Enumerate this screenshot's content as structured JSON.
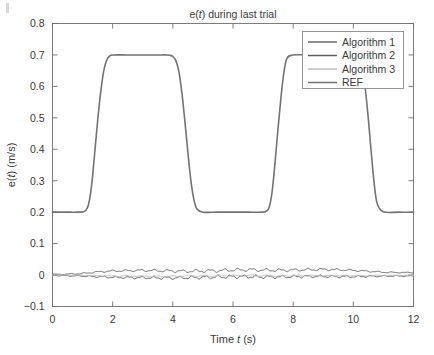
{
  "figure": {
    "title": "e(t) during last trial",
    "title_parts": {
      "pre": "e(",
      "italic": "t",
      "post": ") during last trial"
    },
    "background_color": "#ffffff",
    "axis_color": "#6e6e6e",
    "text_color": "#3a3a3a"
  },
  "axes": {
    "x": {
      "label_parts": {
        "pre": "Time ",
        "italic": "t",
        "post": " (s)"
      },
      "label": "Time t (s)",
      "min": 0,
      "max": 12,
      "tick_values": [
        0,
        2,
        4,
        6,
        8,
        10,
        12
      ],
      "tick_labels": [
        "0",
        "2",
        "4",
        "6",
        "8",
        "10",
        "12"
      ]
    },
    "y": {
      "label_parts": {
        "pre": "e(",
        "italic": "t",
        "post": ") (m/s)"
      },
      "label": "e(t) (m/s)",
      "min": -0.1,
      "max": 0.8,
      "tick_values": [
        -0.1,
        0,
        0.1,
        0.2,
        0.3,
        0.4,
        0.5,
        0.6,
        0.7,
        0.8
      ],
      "tick_labels": [
        "-0.1",
        "0",
        "0.1",
        "0.2",
        "0.3",
        "0.4",
        "0.5",
        "0.6",
        "0.7",
        "0.8"
      ]
    }
  },
  "legend": {
    "position": "top-right",
    "items": [
      {
        "label": "Algorithm 1",
        "color": "#6b6b6b",
        "width": 1.5
      },
      {
        "label": "Algorithm 2",
        "color": "#5f5f5f",
        "width": 1.5
      },
      {
        "label": "Algorithm 3",
        "color": "#bcbcbc",
        "width": 1.5
      },
      {
        "label": "REF",
        "color": "#737373",
        "width": 1.5
      }
    ]
  },
  "chart_data": {
    "type": "line",
    "title": "e(t) during last trial",
    "xlabel": "Time t (s)",
    "ylabel": "e(t) (m/s)",
    "xlim": [
      0,
      12
    ],
    "ylim": [
      -0.1,
      0.8
    ],
    "grid": false,
    "legend_position": "top-right",
    "series": [
      {
        "name": "REF",
        "color": "#737373",
        "comment": "smoothed square/trapezoid wave, low level 0.2, high level 0.7",
        "x": [
          0,
          0.2,
          0.4,
          0.6,
          0.8,
          1.0,
          1.1,
          1.2,
          1.3,
          1.4,
          1.5,
          1.6,
          1.7,
          1.8,
          1.9,
          2.0,
          2.5,
          3.0,
          3.5,
          3.8,
          3.9,
          4.0,
          4.1,
          4.2,
          4.3,
          4.4,
          4.5,
          4.6,
          4.7,
          4.8,
          5.0,
          5.5,
          6.0,
          6.5,
          7.0,
          7.1,
          7.2,
          7.3,
          7.4,
          7.5,
          7.6,
          7.7,
          7.8,
          8.0,
          8.5,
          9.0,
          9.5,
          10.0,
          10.1,
          10.2,
          10.3,
          10.4,
          10.5,
          10.6,
          10.7,
          10.8,
          11.0,
          11.5,
          12.0
        ],
        "y": [
          0.2,
          0.2,
          0.2,
          0.2,
          0.2,
          0.201,
          0.205,
          0.225,
          0.285,
          0.385,
          0.49,
          0.58,
          0.648,
          0.683,
          0.696,
          0.7,
          0.7,
          0.7,
          0.7,
          0.7,
          0.699,
          0.695,
          0.682,
          0.648,
          0.58,
          0.49,
          0.39,
          0.3,
          0.24,
          0.21,
          0.2,
          0.2,
          0.2,
          0.2,
          0.2,
          0.203,
          0.215,
          0.265,
          0.36,
          0.47,
          0.57,
          0.65,
          0.69,
          0.7,
          0.7,
          0.7,
          0.7,
          0.7,
          0.698,
          0.69,
          0.66,
          0.59,
          0.495,
          0.385,
          0.285,
          0.225,
          0.201,
          0.2,
          0.2
        ]
      },
      {
        "name": "Algorithm 1",
        "color": "#6b6b6b",
        "comment": "near-zero error trace, small ripples, slight positive bias mid-record",
        "x": [
          0,
          0.5,
          1.0,
          1.5,
          2.0,
          2.5,
          3.0,
          3.5,
          4.0,
          4.5,
          5.0,
          5.5,
          6.0,
          6.5,
          7.0,
          7.5,
          8.0,
          8.5,
          9.0,
          9.5,
          10.0,
          10.5,
          11.0,
          11.5,
          12.0
        ],
        "y": [
          0.002,
          0.003,
          0.005,
          0.01,
          0.013,
          0.014,
          0.015,
          0.014,
          0.013,
          0.012,
          0.013,
          0.014,
          0.016,
          0.017,
          0.016,
          0.015,
          0.016,
          0.017,
          0.018,
          0.017,
          0.015,
          0.012,
          0.009,
          0.008,
          0.008
        ]
      },
      {
        "name": "Algorithm 2",
        "color": "#5f5f5f",
        "comment": "near-zero error trace, oscillatory ripple slightly below zero",
        "x": [
          0,
          0.5,
          1.0,
          1.5,
          2.0,
          2.5,
          3.0,
          3.5,
          4.0,
          4.5,
          5.0,
          5.5,
          6.0,
          6.5,
          7.0,
          7.5,
          8.0,
          8.5,
          9.0,
          9.5,
          10.0,
          10.5,
          11.0,
          11.5,
          12.0
        ],
        "y": [
          -0.001,
          -0.002,
          -0.003,
          -0.005,
          -0.007,
          -0.008,
          -0.008,
          -0.009,
          -0.009,
          -0.008,
          -0.007,
          -0.006,
          -0.005,
          -0.005,
          -0.006,
          -0.006,
          -0.005,
          -0.004,
          -0.004,
          -0.005,
          -0.005,
          -0.004,
          -0.003,
          -0.003,
          -0.003
        ]
      },
      {
        "name": "Algorithm 3",
        "color": "#bcbcbc",
        "comment": "near-zero error trace, lightest grey, very small amplitude",
        "x": [
          0,
          0.5,
          1.0,
          1.5,
          2.0,
          2.5,
          3.0,
          3.5,
          4.0,
          4.5,
          5.0,
          5.5,
          6.0,
          6.5,
          7.0,
          7.5,
          8.0,
          8.5,
          9.0,
          9.5,
          10.0,
          10.5,
          11.0,
          11.5,
          12.0
        ],
        "y": [
          0.0,
          0.0,
          -0.001,
          -0.002,
          -0.003,
          -0.003,
          -0.004,
          -0.004,
          -0.004,
          -0.003,
          -0.003,
          -0.002,
          -0.002,
          -0.002,
          -0.002,
          -0.003,
          -0.002,
          -0.002,
          -0.002,
          -0.002,
          -0.002,
          -0.002,
          -0.001,
          -0.001,
          -0.001
        ]
      }
    ]
  }
}
